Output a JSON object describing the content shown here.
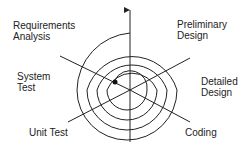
{
  "diagram": {
    "phases": [
      {
        "label": "Requirements\nAnalysis"
      },
      {
        "label": "Preliminary\nDesign"
      },
      {
        "label": "Detailed\nDesign"
      },
      {
        "label": "Coding"
      },
      {
        "label": "Unit Test"
      },
      {
        "label": "System\nTest"
      }
    ],
    "colors": {
      "line": "#222222",
      "text": "#222222",
      "background": "#ffffff"
    }
  }
}
